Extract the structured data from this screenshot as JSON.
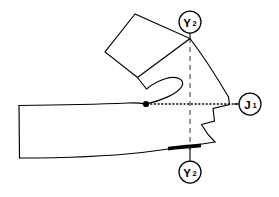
{
  "figure": {
    "background_color": "#ffffff",
    "stroke_color": "#000000",
    "width": 279,
    "height": 197
  },
  "callouts": [
    {
      "id": "callout-y2-top",
      "symbol": "Y",
      "subscript": "2",
      "label": "Y2",
      "center_x": 190,
      "center_y": 22,
      "radius": 11,
      "leader_to_x": 190,
      "leader_to_y": 39,
      "position": "top"
    },
    {
      "id": "callout-j1-right",
      "symbol": "J",
      "subscript": "1",
      "label": "J1",
      "center_x": 250,
      "center_y": 104,
      "radius": 11,
      "leader_to_x": 234,
      "leader_to_y": 104,
      "position": "right"
    },
    {
      "id": "callout-y2-bottom",
      "symbol": "Y",
      "subscript": "2",
      "label": "Y2",
      "center_x": 190,
      "center_y": 172,
      "radius": 11,
      "leader_to_x": 190,
      "leader_to_y": 148,
      "position": "bottom"
    }
  ],
  "axes": {
    "vertical_dashed": {
      "name": "vertical-reference-axis",
      "x": 190,
      "y_start": 38,
      "y_end": 150,
      "style": "dashed",
      "color": "#3a3a3a"
    },
    "horizontal_dotted": {
      "name": "horizontal-reference-axis",
      "y": 104,
      "x_start": 147,
      "x_end": 239,
      "style": "dotted",
      "color": "#000000"
    }
  },
  "markers": {
    "pivot_point": {
      "name": "pivot-point",
      "x": 146,
      "y": 104,
      "radius": 3.1,
      "color": "#000000"
    },
    "emphasized_segment": {
      "name": "emphasized-edge-segment",
      "x_start": 168,
      "y_start": 148.6,
      "x_end": 201,
      "y_end": 145.4,
      "color": "#000000",
      "stroke_width": 3.6
    }
  },
  "paths": {
    "upper_quadrilateral": "M 135 14 L 105 52 L 137.5 77.5 L 190 38.5 Z",
    "right_arc": "M 190 38.5 C 201 53 215 74 228.5 97",
    "right_notch": "M 228.5 97 L 229.5 104.5 L 213 108.5 L 214.5 121 L 201.5 124.5 L 208 134.5 L 215 142",
    "lower_contour": "M 215 142 C 196 145 170 149 142 152.5 C 110 156 60 158 19.5 158",
    "left_edge": "M 19.5 158 L 19 105.5",
    "upper_contour": "M 19 105.5 C 60 105 103 104 128 103 C 138 102.5 143 103.5 146 104",
    "inner_hook": "M 146 104 C 160 101 178 94 182 86 C 185 79 176 75.5 166 78.5 C 158 81 150 86 146.5 89 L 137.5 77.5"
  }
}
